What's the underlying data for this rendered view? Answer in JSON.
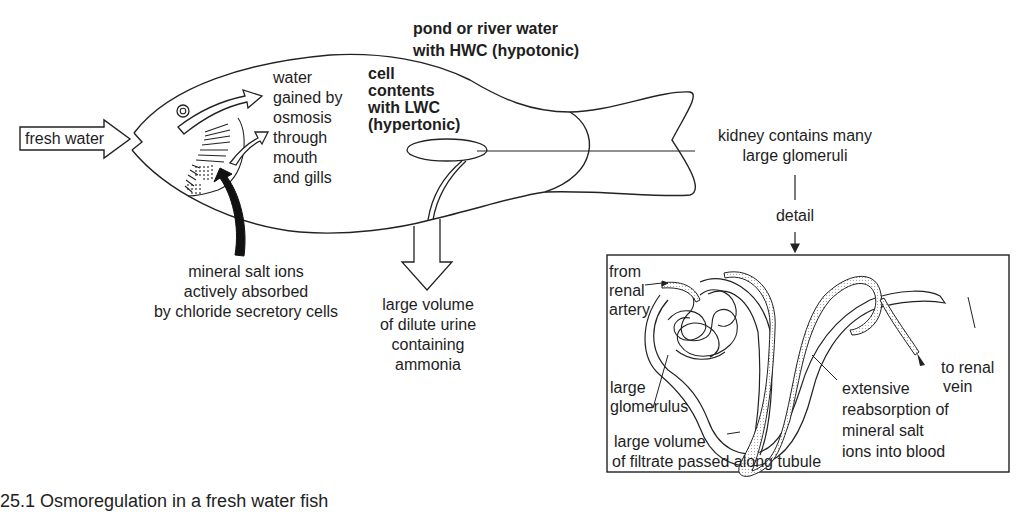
{
  "figure": {
    "caption": "25.1  Osmoregulation in a fresh water fish",
    "colors": {
      "ink": "#1e1e1e",
      "background": "#ffffff",
      "arrow_fill": "#111111",
      "stipple": "#bdbdbd"
    }
  },
  "fish": {
    "input_arrow_label": "fresh water",
    "water_gain_label": [
      "water",
      "gained by",
      "osmosis",
      "through",
      "mouth",
      "and gills"
    ],
    "environment_label": [
      "pond or river water",
      "with HWC (hypotonic)"
    ],
    "cell_contents_label": [
      "cell",
      "contents",
      "with LWC",
      "(hypertonic)"
    ],
    "salt_uptake_label": [
      "mineral salt ions",
      "actively absorbed",
      "by chloride secretory cells"
    ],
    "urine_label": [
      "large volume",
      "of dilute urine",
      "containing",
      "ammonia"
    ],
    "kidney_label": [
      "kidney contains many",
      "large glomeruli"
    ],
    "detail_label": "detail"
  },
  "detail_panel": {
    "from_artery_label": [
      "from",
      "renal",
      "artery"
    ],
    "glomerulus_label": [
      "large",
      "glomerulus"
    ],
    "filtrate_label": [
      "large volume",
      "of filtrate passed along tubule"
    ],
    "reabsorption_label": [
      "extensive",
      "reabsorption of",
      "mineral salt",
      "ions into blood"
    ],
    "vein_label": [
      "to renal",
      "vein"
    ]
  }
}
